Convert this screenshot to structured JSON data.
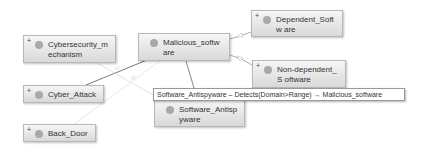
{
  "diagram": {
    "nodes": [
      {
        "id": "cybersecurity_mechanism",
        "label": "Cybersecurity_m echanism",
        "expander": "+",
        "x": 23,
        "y": 35,
        "w": 93,
        "h": 28
      },
      {
        "id": "malicious_software",
        "label": "Malicious_softw are",
        "expander": "",
        "x": 138,
        "y": 33,
        "w": 92,
        "h": 28
      },
      {
        "id": "dependent_software",
        "label": "Dependent_Softw are",
        "expander": "+",
        "x": 251,
        "y": 10,
        "w": 92,
        "h": 27
      },
      {
        "id": "non_dependent_software",
        "label": "Non-dependent_S oftware",
        "expander": "+",
        "x": 252,
        "y": 60,
        "w": 94,
        "h": 28
      },
      {
        "id": "cyber_attack",
        "label": "Cyber_Attack",
        "expander": "+",
        "x": 23,
        "y": 85,
        "w": 81,
        "h": 18
      },
      {
        "id": "back_door",
        "label": "Back_Door",
        "expander": "+",
        "x": 23,
        "y": 124,
        "w": 73,
        "h": 18
      },
      {
        "id": "software_antispyware",
        "label": "Software_Antisp yware",
        "expander": "",
        "x": 154,
        "y": 99,
        "w": 91,
        "h": 28
      }
    ],
    "tooltip": {
      "text": "Software_Antispyware – Detects(Domain>Range) → Malicious_software"
    }
  }
}
